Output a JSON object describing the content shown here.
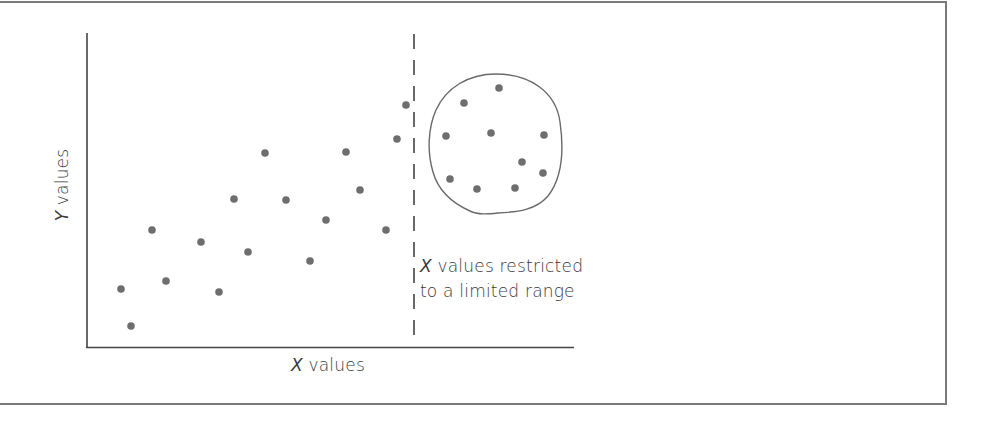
{
  "chart_data": {
    "type": "scatter",
    "title": "",
    "xlabel_var": "X",
    "xlabel_rest": " values",
    "ylabel_var": "Y",
    "ylabel_rest": " values",
    "grid": false,
    "legend": null,
    "axis_ticks": false,
    "annotation": {
      "line1_var": "X",
      "line1_rest": " values restricted",
      "line2": "to a limited range"
    },
    "series": [
      {
        "name": "full-range points",
        "points": [
          {
            "x": 121,
            "y": 289
          },
          {
            "x": 131,
            "y": 326
          },
          {
            "x": 152,
            "y": 230
          },
          {
            "x": 166,
            "y": 281
          },
          {
            "x": 201,
            "y": 242
          },
          {
            "x": 219,
            "y": 292
          },
          {
            "x": 234,
            "y": 199
          },
          {
            "x": 248,
            "y": 252
          },
          {
            "x": 265,
            "y": 153
          },
          {
            "x": 286,
            "y": 200
          },
          {
            "x": 310,
            "y": 261
          },
          {
            "x": 326,
            "y": 220
          },
          {
            "x": 346,
            "y": 152
          },
          {
            "x": 360,
            "y": 190
          },
          {
            "x": 386,
            "y": 230
          },
          {
            "x": 397,
            "y": 139
          },
          {
            "x": 406,
            "y": 105
          }
        ]
      },
      {
        "name": "restricted-range points (circled)",
        "points": [
          {
            "x": 499,
            "y": 88
          },
          {
            "x": 464,
            "y": 103
          },
          {
            "x": 446,
            "y": 136
          },
          {
            "x": 491,
            "y": 133
          },
          {
            "x": 544,
            "y": 135
          },
          {
            "x": 522,
            "y": 162
          },
          {
            "x": 543,
            "y": 173
          },
          {
            "x": 450,
            "y": 179
          },
          {
            "x": 477,
            "y": 189
          },
          {
            "x": 515,
            "y": 188
          }
        ]
      }
    ],
    "restriction_line_x": 414,
    "colors": {
      "points": "#6e6e6e",
      "axes": "#444444",
      "frame": "#7a7a7a",
      "text": "#3a3a3a"
    }
  }
}
